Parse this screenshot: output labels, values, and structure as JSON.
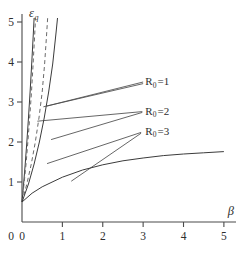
{
  "chart_data": {
    "type": "line",
    "title": "",
    "xlabel": "β",
    "ylabel": "ε",
    "ylabel_sub": "q",
    "xlim": [
      0,
      5.3
    ],
    "ylim": [
      0,
      5.2
    ],
    "xticks": [
      0,
      1,
      2,
      3,
      4,
      5
    ],
    "xticklabels": [
      "0",
      "1",
      "2",
      "3",
      "4",
      "5"
    ],
    "yticks": [
      1,
      2,
      3,
      4,
      5
    ],
    "yticklabels": [
      "1",
      "2",
      "3",
      "4",
      "5"
    ],
    "grid": false,
    "legend_position": "inline-annotations",
    "common_origin": [
      0.0,
      0.5
    ],
    "annotations": [
      {
        "text": "R",
        "sub": "0",
        "eq": "=1",
        "x": 3.05,
        "y": 3.52
      },
      {
        "text": "R",
        "sub": "0",
        "eq": "=2",
        "x": 3.05,
        "y": 2.78
      },
      {
        "text": "R",
        "sub": "0",
        "eq": "=3",
        "x": 3.05,
        "y": 2.28
      }
    ],
    "series": [
      {
        "name": "R0=1 solid",
        "style": "solid",
        "label": "R₀ =1",
        "points": [
          [
            0.0,
            0.5
          ],
          [
            0.04,
            0.95
          ],
          [
            0.08,
            1.45
          ],
          [
            0.12,
            2.0
          ],
          [
            0.16,
            2.6
          ],
          [
            0.2,
            3.25
          ],
          [
            0.24,
            3.95
          ],
          [
            0.28,
            4.7
          ],
          [
            0.3,
            5.1
          ]
        ]
      },
      {
        "name": "R0=1 dashed",
        "style": "dashed",
        "label": "R₀ =1",
        "points": [
          [
            0.0,
            0.5
          ],
          [
            0.05,
            0.95
          ],
          [
            0.1,
            1.45
          ],
          [
            0.145,
            2.0
          ],
          [
            0.19,
            2.6
          ],
          [
            0.235,
            3.25
          ],
          [
            0.275,
            3.95
          ],
          [
            0.315,
            4.7
          ],
          [
            0.335,
            5.1
          ]
        ]
      },
      {
        "name": "R0=2 dashed",
        "style": "dashed",
        "label": "R₀ =2",
        "points": [
          [
            0.0,
            0.5
          ],
          [
            0.12,
            0.95
          ],
          [
            0.23,
            1.45
          ],
          [
            0.33,
            2.0
          ],
          [
            0.42,
            2.6
          ],
          [
            0.5,
            3.25
          ],
          [
            0.56,
            3.95
          ],
          [
            0.61,
            4.7
          ],
          [
            0.635,
            5.1
          ]
        ]
      },
      {
        "name": "R0=2 solid",
        "style": "solid",
        "label": "R₀ =2",
        "points": [
          [
            0.0,
            0.5
          ],
          [
            0.16,
            0.95
          ],
          [
            0.3,
            1.45
          ],
          [
            0.43,
            2.0
          ],
          [
            0.55,
            2.6
          ],
          [
            0.66,
            3.25
          ],
          [
            0.76,
            3.95
          ],
          [
            0.84,
            4.7
          ],
          [
            0.88,
            5.1
          ]
        ]
      },
      {
        "name": "R0=3 solid",
        "style": "solid",
        "label": "R₀ =3",
        "points": [
          [
            0.0,
            0.5
          ],
          [
            0.25,
            0.72
          ],
          [
            0.5,
            0.88
          ],
          [
            1.0,
            1.12
          ],
          [
            1.5,
            1.3
          ],
          [
            2.0,
            1.43
          ],
          [
            2.5,
            1.53
          ],
          [
            3.0,
            1.6
          ],
          [
            3.5,
            1.66
          ],
          [
            4.0,
            1.7
          ],
          [
            4.5,
            1.73
          ],
          [
            5.0,
            1.76
          ]
        ]
      }
    ],
    "leaders": [
      {
        "from": [
          3.0,
          3.5
        ],
        "to": [
          0.62,
          2.9
        ]
      },
      {
        "from": [
          3.0,
          3.46
        ],
        "to": [
          0.53,
          2.88
        ]
      },
      {
        "from": [
          2.98,
          2.76
        ],
        "to": [
          0.38,
          2.52
        ]
      },
      {
        "from": [
          2.98,
          2.74
        ],
        "to": [
          0.72,
          2.06
        ]
      },
      {
        "from": [
          2.95,
          2.24
        ],
        "to": [
          0.62,
          1.46
        ]
      },
      {
        "from": [
          2.95,
          2.22
        ],
        "to": [
          1.22,
          1.02
        ]
      }
    ]
  }
}
